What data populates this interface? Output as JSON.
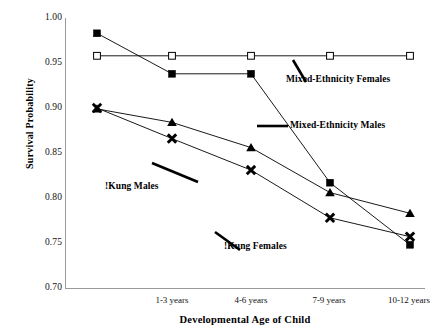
{
  "chart_data": {
    "type": "line",
    "title": "",
    "xlabel": "Developmental Age of Child",
    "ylabel": "Survival Probability",
    "categories": [
      "",
      "1-3 years",
      "4-6 years",
      "7-9 years",
      "10-12 years"
    ],
    "x_tick_labels": [
      "1-3 years",
      "4-6 years",
      "7-9 years",
      "10-12 years"
    ],
    "y_tick_labels": [
      "1.00",
      "0.95",
      "0.90",
      "0.85",
      "0.80",
      "0.75",
      "0.70"
    ],
    "y_tick_values": [
      1.0,
      0.95,
      0.9,
      0.85,
      0.8,
      0.75,
      0.7
    ],
    "ylim": [
      0.7,
      1.0
    ],
    "grid": false,
    "legend_position": "inline-annotations",
    "series": [
      {
        "name": "Mixed-Ethnicity Females",
        "marker": "open-square",
        "values": [
          0.958,
          0.958,
          0.958,
          0.958,
          0.958
        ]
      },
      {
        "name": "Mixed-Ethnicity Males",
        "marker": "filled-square",
        "values": [
          0.983,
          0.938,
          0.938,
          0.817,
          0.748
        ]
      },
      {
        "name": "!Kung Males",
        "marker": "filled-triangle",
        "values": [
          0.899,
          0.884,
          0.856,
          0.806,
          0.783
        ]
      },
      {
        "name": "!Kung Females",
        "marker": "x-cross",
        "values": [
          0.9,
          0.866,
          0.831,
          0.778,
          0.757
        ]
      }
    ],
    "annotations": [
      {
        "id": "mixed-ethnicity-females",
        "text": "Mixed-Ethnicity Females"
      },
      {
        "id": "mixed-ethnicity-males",
        "text": "Mixed-Ethnicity Males"
      },
      {
        "id": "kung-males",
        "text": "!Kung Males"
      },
      {
        "id": "kung-females",
        "text": "!Kung Females"
      }
    ],
    "colors": {
      "line": "#000000",
      "axis": "#9a9a9a",
      "text": "#000000",
      "background": "#ffffff"
    }
  }
}
